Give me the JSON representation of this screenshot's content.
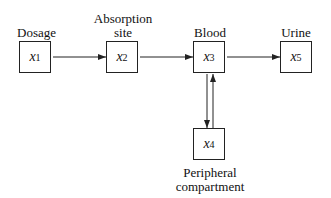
{
  "nodes": [
    {
      "id": "x1",
      "var": "x",
      "sub": "1",
      "label": "Dosage"
    },
    {
      "id": "x2",
      "var": "x",
      "sub": "2",
      "label_line1": "Absorption",
      "label_line2": "site"
    },
    {
      "id": "x3",
      "var": "x",
      "sub": "3",
      "label": "Blood"
    },
    {
      "id": "x4",
      "var": "x",
      "sub": "4",
      "label_line1": "Peripheral",
      "label_line2": "compartment"
    },
    {
      "id": "x5",
      "var": "x",
      "sub": "5",
      "label": "Urine"
    }
  ],
  "edges": [
    {
      "from": "x1",
      "to": "x2"
    },
    {
      "from": "x2",
      "to": "x3"
    },
    {
      "from": "x3",
      "to": "x5"
    },
    {
      "from": "x3",
      "to": "x4"
    },
    {
      "from": "x4",
      "to": "x3"
    }
  ]
}
